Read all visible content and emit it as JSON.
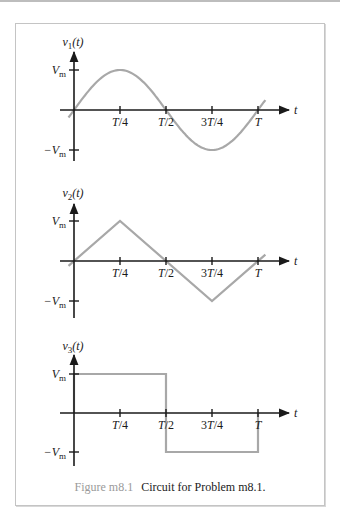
{
  "caption": {
    "figure_label": "Figure m8.1",
    "text": "Circuit for Problem m8.1."
  },
  "chart_data": [
    {
      "type": "line",
      "title": "",
      "ylabel": "v1(t)",
      "ylabel_parts": {
        "var": "v",
        "sub": "1",
        "arg": "(t)"
      },
      "xlabel": "t",
      "x_ticks": [
        "T/4",
        "T/2",
        "3T/4",
        "T"
      ],
      "y_ticks": [
        "Vm",
        "-Vm"
      ],
      "waveform": "sine",
      "x": [
        -0.03,
        0,
        0.25,
        0.5,
        0.75,
        1.0,
        1.04
      ],
      "y": [
        -0.19,
        0,
        1,
        0,
        -1,
        0,
        0.25
      ],
      "xlim_units": "fraction of period T",
      "ylim_units": "fraction of Vm",
      "xlim": [
        0,
        1
      ],
      "ylim": [
        -1,
        1
      ],
      "grid": false
    },
    {
      "type": "line",
      "title": "",
      "ylabel": "v2(t)",
      "ylabel_parts": {
        "var": "v",
        "sub": "2",
        "arg": "(t)"
      },
      "xlabel": "t",
      "x_ticks": [
        "T/4",
        "T/2",
        "3T/4",
        "T"
      ],
      "y_ticks": [
        "Vm",
        "-Vm"
      ],
      "waveform": "triangle",
      "x": [
        -0.03,
        0.25,
        0.75,
        1.04
      ],
      "y": [
        -0.12,
        1,
        -1,
        0.16
      ],
      "xlim": [
        0,
        1
      ],
      "ylim": [
        -1,
        1
      ],
      "grid": false
    },
    {
      "type": "line",
      "title": "",
      "ylabel": "v3(t)",
      "ylabel_parts": {
        "var": "v",
        "sub": "3",
        "arg": "(t)"
      },
      "xlabel": "t",
      "x_ticks": [
        "T/4",
        "T/2",
        "3T/4",
        "T"
      ],
      "y_ticks": [
        "Vm",
        "-Vm"
      ],
      "waveform": "square",
      "x": [
        0,
        0,
        0.5,
        0.5,
        1.0,
        1.0
      ],
      "y": [
        0,
        1,
        1,
        -1,
        -1,
        0
      ],
      "xlim": [
        0,
        1
      ],
      "ylim": [
        -1,
        1
      ],
      "grid": false
    }
  ]
}
